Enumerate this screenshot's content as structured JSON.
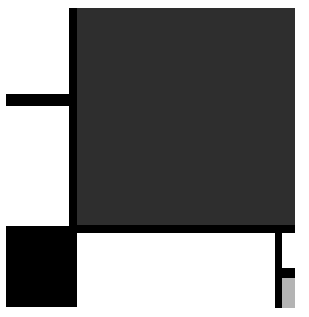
{
  "composition": {
    "style": "abstract geometric blocks",
    "colors": {
      "background": "#ffffff",
      "black": "#000000",
      "dark_gray": "#2e2e2e",
      "light_gray": "#b4b4b4"
    },
    "shapes": [
      {
        "name": "dark-gray-square",
        "x": 77,
        "y": 8,
        "w": 218,
        "h": 217,
        "color": "#2e2e2e"
      },
      {
        "name": "left-vertical-bar",
        "x": 69,
        "y": 8,
        "w": 8,
        "h": 225,
        "color": "#000000"
      },
      {
        "name": "bottom-horizontal-bar",
        "x": 69,
        "y": 225,
        "w": 226,
        "h": 8,
        "color": "#000000"
      },
      {
        "name": "left-horizontal-bar",
        "x": 6,
        "y": 94,
        "w": 64,
        "h": 12,
        "color": "#000000"
      },
      {
        "name": "black-square",
        "x": 6,
        "y": 226,
        "w": 71,
        "h": 81,
        "color": "#000000"
      },
      {
        "name": "right-vertical-bar",
        "x": 275,
        "y": 233,
        "w": 7,
        "h": 75,
        "color": "#000000"
      },
      {
        "name": "small-horizontal-bar",
        "x": 282,
        "y": 268,
        "w": 13,
        "h": 10,
        "color": "#000000"
      },
      {
        "name": "light-gray-block",
        "x": 282,
        "y": 278,
        "w": 13,
        "h": 30,
        "color": "#b4b4b4"
      }
    ]
  }
}
